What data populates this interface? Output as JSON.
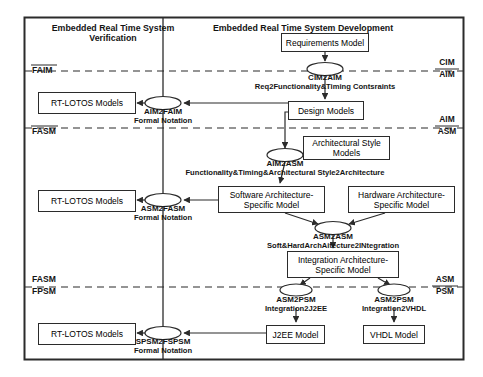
{
  "diagram": {
    "titles": [
      {
        "id": "title-left",
        "text": "Embedded Real Time System\nVerification",
        "x": 113,
        "y": 24
      },
      {
        "id": "title-right",
        "text": "Embedded Real Time System Development",
        "x": 303,
        "y": 24
      }
    ],
    "boxes": [
      {
        "id": "requirements-model",
        "label": "Requirements Model",
        "x": 281,
        "y": 33,
        "w": 88,
        "h": 19
      },
      {
        "id": "design-models",
        "label": "Design Models",
        "x": 288,
        "y": 101,
        "w": 76,
        "h": 19
      },
      {
        "id": "architectural-style-models",
        "label": "Architectural Style\nModels",
        "x": 303,
        "y": 136,
        "w": 87,
        "h": 24
      },
      {
        "id": "software-arch-model",
        "label": "Software Architecture-\nSpecific Model",
        "x": 218,
        "y": 186,
        "w": 107,
        "h": 27
      },
      {
        "id": "hardware-arch-model",
        "label": "Hardware Architecture-\nSpecific Model",
        "x": 348,
        "y": 186,
        "w": 107,
        "h": 27
      },
      {
        "id": "integration-arch-model",
        "label": "Integration Architecture-\nSpecific Model",
        "x": 287,
        "y": 251,
        "w": 112,
        "h": 27
      },
      {
        "id": "j2ee-model",
        "label": "J2EE Model",
        "x": 266,
        "y": 325,
        "w": 59,
        "h": 19
      },
      {
        "id": "vhdl-model",
        "label": "VHDL Model",
        "x": 363,
        "y": 325,
        "w": 62,
        "h": 19
      },
      {
        "id": "rt-lotos-aim",
        "label": "RT-LOTOS Models",
        "x": 38,
        "y": 92,
        "w": 98,
        "h": 22
      },
      {
        "id": "rt-lotos-asm",
        "label": "RT-LOTOS Models",
        "x": 38,
        "y": 190,
        "w": 98,
        "h": 22
      },
      {
        "id": "rt-lotos-psm",
        "label": "RT-LOTOS Models",
        "x": 38,
        "y": 323,
        "w": 98,
        "h": 22
      }
    ],
    "transforms": [
      {
        "id": "cim2aim",
        "name": "CIM2AIM",
        "sub": "Req2Functionality&Timing Contsraints",
        "cx": 325,
        "cy": 69,
        "rx": 18,
        "ry": 6.5,
        "name_y": 74,
        "sub_y": 83
      },
      {
        "id": "aim2faim",
        "name": "AIM2FAIM",
        "sub": "Formal Notation",
        "cx": 163,
        "cy": 103,
        "rx": 18,
        "ry": 6.5,
        "name_y": 108,
        "sub_y": 117
      },
      {
        "id": "aim2asm",
        "name": "AIM2ASM",
        "sub": "Functionality&Timing&Architectural Style2Architecture",
        "cx": 285,
        "cy": 155,
        "rx": 18,
        "ry": 6.5,
        "name_y": 160,
        "sub_y": 169
      },
      {
        "id": "asm2fasm",
        "name": "ASM2FASM",
        "sub": "Formal Notation",
        "cx": 163,
        "cy": 200,
        "rx": 18,
        "ry": 6.5,
        "name_y": 205,
        "sub_y": 214
      },
      {
        "id": "asm2asm",
        "name": "ASM2ASM",
        "sub": "Soft&HardArchAitecture2INtegration",
        "cx": 333,
        "cy": 228,
        "rx": 18,
        "ry": 6.5,
        "name_y": 233,
        "sub_y": 242
      },
      {
        "id": "asm2psm-j2ee",
        "name": "ASM2PSM",
        "sub": "Integration2J2EE",
        "cx": 296,
        "cy": 290,
        "rx": 16,
        "ry": 6,
        "name_y": 296,
        "sub_y": 305
      },
      {
        "id": "asm2psm-vhdl",
        "name": "ASM2PSM",
        "sub": "Integration2VHDL",
        "cx": 394,
        "cy": 290,
        "rx": 16,
        "ry": 6,
        "name_y": 296,
        "sub_y": 305
      },
      {
        "id": "spsm2fspsm",
        "name": "SPSM2FSPSM",
        "sub": "Formal Notation",
        "cx": 163,
        "cy": 333,
        "rx": 18,
        "ry": 6.5,
        "name_y": 338,
        "sub_y": 347
      }
    ],
    "zone_labels": [
      {
        "id": "faim-label",
        "text": "FAIM",
        "x": 32,
        "y": 71
      },
      {
        "id": "fasm-label",
        "text": "FASM",
        "x": 32,
        "y": 132
      },
      {
        "id": "fasm-label-lower",
        "text": "FASM",
        "x": 32,
        "y": 277
      },
      {
        "id": "fpsm-label",
        "text": "FPSM",
        "x": 32,
        "y": 288
      }
    ],
    "side_labels": [
      {
        "id": "cim-aim-label",
        "top": "CIM",
        "bottom": "AIM",
        "x": 447,
        "y": 60
      },
      {
        "id": "aim-asm-label",
        "top": "AIM",
        "bottom": "ASM",
        "x": 447,
        "y": 117
      },
      {
        "id": "asm-psm-label",
        "top": "ASM",
        "bottom": "PSM",
        "x": 447,
        "y": 277
      }
    ],
    "dividers": {
      "cim_aim_y": 71,
      "aim_asm_y": 128,
      "fasm_fpsm_y": 287,
      "vertical_x": 163
    },
    "frame": {
      "x": 24,
      "y": 17,
      "w": 440,
      "h": 343
    },
    "colors": {
      "stroke": "#2b2b2b",
      "text": "#141414",
      "background": "#ffffff"
    }
  }
}
